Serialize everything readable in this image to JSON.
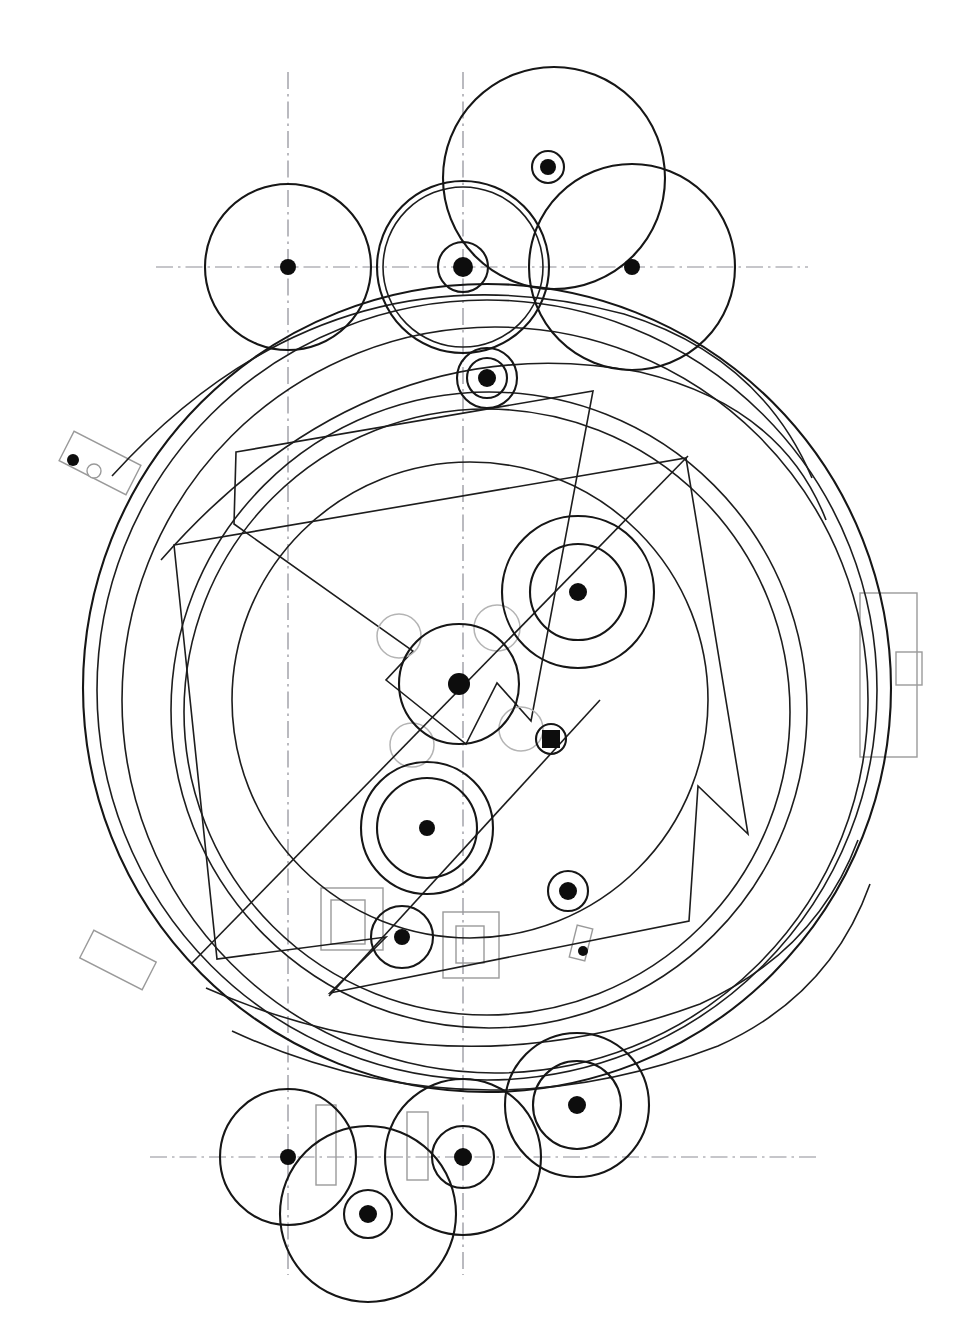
{
  "document": {
    "title": "Mechanical Assembly Layout Drawing",
    "kind": "engineering-line-drawing",
    "background_color": "#ffffff",
    "line_color": "#161616",
    "light_line_color": "#b4b4b4",
    "centerline_color": "#8d8d96",
    "width": 970,
    "height": 1330
  },
  "chart_data": {
    "type": "diagram",
    "xlabel": "",
    "ylabel": "",
    "grid": false,
    "legend": "none",
    "units": "pixels",
    "centerlines": {
      "horizontal": [
        {
          "name": "upper-horizontal-centerline",
          "y": 267,
          "x1": 156,
          "x2": 808
        },
        {
          "name": "lower-horizontal-centerline",
          "y": 1157,
          "x1": 150,
          "x2": 818
        }
      ],
      "vertical": [
        {
          "name": "left-vertical-centerline",
          "x": 288,
          "y1": 72,
          "y2": 1275
        },
        {
          "name": "right-vertical-centerline",
          "x": 463,
          "y1": 72,
          "y2": 1275
        }
      ]
    },
    "outer_arcs": [
      {
        "name": "outer-rim-1",
        "cx": 487,
        "cy": 688,
        "r": 404,
        "weight": "main"
      },
      {
        "name": "outer-rim-2",
        "cx": 487,
        "cy": 690,
        "r": 390,
        "weight": "thin"
      },
      {
        "name": "outer-rim-3",
        "cx": 495,
        "cy": 700,
        "r": 373,
        "weight": "thin"
      },
      {
        "name": "inner-rim-1",
        "cx": 489,
        "cy": 710,
        "r": 318,
        "weight": "thin"
      },
      {
        "name": "inner-rim-2",
        "cx": 487,
        "cy": 712,
        "r": 303,
        "weight": "thin"
      },
      {
        "name": "mid-ring",
        "cx": 470,
        "cy": 700,
        "r": 238,
        "weight": "thin"
      }
    ],
    "major_circles": [
      {
        "name": "top-left-circle",
        "cx": 288,
        "cy": 267,
        "r": 83,
        "weight": "main"
      },
      {
        "name": "top-mid-circle",
        "cx": 463,
        "cy": 267,
        "r": 86,
        "weight": "main"
      },
      {
        "name": "top-mid-circle-inner",
        "cx": 463,
        "cy": 267,
        "r": 80,
        "weight": "thin"
      },
      {
        "name": "top-apex-circle",
        "cx": 554,
        "cy": 178,
        "r": 111,
        "weight": "main"
      },
      {
        "name": "top-right-circle",
        "cx": 632,
        "cy": 267,
        "r": 103,
        "weight": "main"
      }
    ],
    "hub_markers": [
      {
        "name": "hub-top-left",
        "cx": 288,
        "cy": 267,
        "r_dot": 8
      },
      {
        "name": "hub-top-mid",
        "cx": 463,
        "cy": 267,
        "r_dot": 10,
        "rings": [
          25
        ]
      },
      {
        "name": "hub-top-apex",
        "cx": 548,
        "cy": 167,
        "r_dot": 8,
        "rings": [
          16
        ]
      },
      {
        "name": "hub-top-right",
        "cx": 632,
        "cy": 267,
        "r_dot": 8
      },
      {
        "name": "hub-upper-stem",
        "cx": 487,
        "cy": 378,
        "r_dot": 9,
        "rings": [
          20,
          30
        ]
      },
      {
        "name": "hub-right-mid",
        "cx": 578,
        "cy": 592,
        "r_dot": 9,
        "rings": [
          48,
          76
        ]
      },
      {
        "name": "hub-center-main",
        "cx": 459,
        "cy": 684,
        "r_dot": 11,
        "rings": [
          60
        ]
      },
      {
        "name": "hub-square-pin",
        "cx": 551,
        "cy": 739,
        "r_dot": 9,
        "shape": "square",
        "rings": [
          15
        ]
      },
      {
        "name": "hub-lower-left",
        "cx": 427,
        "cy": 828,
        "r_dot": 8,
        "rings": [
          50,
          66
        ]
      },
      {
        "name": "hub-lower-small",
        "cx": 402,
        "cy": 937,
        "r_dot": 8,
        "rings": [
          31
        ]
      },
      {
        "name": "hub-lower-right",
        "cx": 568,
        "cy": 891,
        "r_dot": 9,
        "rings": [
          20
        ]
      },
      {
        "name": "hub-bottom-left",
        "cx": 288,
        "cy": 1157,
        "r_dot": 8,
        "rings": [
          68
        ]
      },
      {
        "name": "hub-bottom-drop",
        "cx": 368,
        "cy": 1214,
        "r_dot": 9,
        "rings": [
          24,
          88
        ]
      },
      {
        "name": "hub-bottom-mid",
        "cx": 463,
        "cy": 1157,
        "r_dot": 9,
        "rings": [
          31,
          78
        ]
      },
      {
        "name": "hub-bottom-right",
        "cx": 577,
        "cy": 1105,
        "r_dot": 9,
        "rings": [
          44,
          72
        ]
      }
    ],
    "light_circles": [
      {
        "name": "light-circle-upper-left",
        "cx": 399,
        "cy": 636,
        "r": 22
      },
      {
        "name": "light-circle-upper-right",
        "cx": 497,
        "cy": 628,
        "r": 23
      },
      {
        "name": "light-circle-lower-left",
        "cx": 412,
        "cy": 745,
        "r": 22
      },
      {
        "name": "light-circle-lower-right",
        "cx": 521,
        "cy": 729,
        "r": 22
      }
    ],
    "gray_rectangles": [
      {
        "name": "left-tab-bracket",
        "cx": 100,
        "cy": 463,
        "w": 75,
        "h": 33,
        "rot": 27
      },
      {
        "name": "lower-left-tab-bracket",
        "cx": 118,
        "cy": 960,
        "w": 70,
        "h": 31,
        "rot": 27
      },
      {
        "name": "right-flange-plate",
        "x": 860,
        "y": 593,
        "w": 57,
        "h": 164
      },
      {
        "name": "right-flange-boss",
        "x": 896,
        "y": 652,
        "w": 26,
        "h": 33
      },
      {
        "name": "lower-mid-plate-a-outer",
        "x": 321,
        "y": 888,
        "w": 62,
        "h": 62
      },
      {
        "name": "lower-mid-plate-a-inner",
        "x": 331,
        "y": 900,
        "w": 34,
        "h": 44
      },
      {
        "name": "lower-mid-plate-b-outer",
        "x": 443,
        "y": 912,
        "w": 56,
        "h": 66
      },
      {
        "name": "lower-mid-plate-b-inner",
        "x": 456,
        "y": 926,
        "w": 28,
        "h": 37
      },
      {
        "name": "bottom-slot-left",
        "x": 316,
        "y": 1105,
        "w": 20,
        "h": 80
      },
      {
        "name": "bottom-slot-right",
        "x": 407,
        "y": 1112,
        "w": 21,
        "h": 68
      },
      {
        "name": "small-pin-plate",
        "cx": 581,
        "cy": 943,
        "w": 16,
        "h": 33,
        "rot": 14
      }
    ],
    "small_markers": [
      {
        "name": "left-tab-dot",
        "cx": 73,
        "cy": 460,
        "r": 6,
        "fill": "solid"
      },
      {
        "name": "left-tab-hole",
        "cx": 94,
        "cy": 471,
        "r": 7,
        "fill": "open"
      },
      {
        "name": "pin-plate-dot",
        "cx": 583,
        "cy": 951,
        "r": 5,
        "fill": "solid"
      }
    ],
    "wedge_polygons": [
      {
        "name": "upper-chevron-wedge",
        "points": "236,452 593,391 531,721 497,683 466,744 386,680 413,651 234,524"
      },
      {
        "name": "lower-chevron-wedge",
        "points": "174,545 686,458 748,834 698,786 689,921 330,993 386,937 217,959"
      }
    ],
    "sweep_arcs": [
      {
        "name": "sweep-arc-upper",
        "d": "M 112 476 Q 330 236 624 314 Q 760 356 812 478"
      },
      {
        "name": "sweep-arc-mid",
        "d": "M 161 560 Q 370 322 640 372 Q 782 406 826 520"
      },
      {
        "name": "sweep-arc-lower",
        "d": "M 206 988 Q 450 1096 700 1004 Q 816 952 858 840"
      },
      {
        "name": "sweep-arc-bottom",
        "d": "M 232 1031 Q 470 1141 718 1046 Q 830 996 870 884"
      }
    ],
    "diagonal_lines": [
      {
        "name": "main-diagonal-axis",
        "x1": 192,
        "y1": 963,
        "x2": 688,
        "y2": 456
      },
      {
        "name": "secondary-diagonal",
        "x1": 329,
        "y1": 996,
        "x2": 600,
        "y2": 700
      }
    ]
  }
}
